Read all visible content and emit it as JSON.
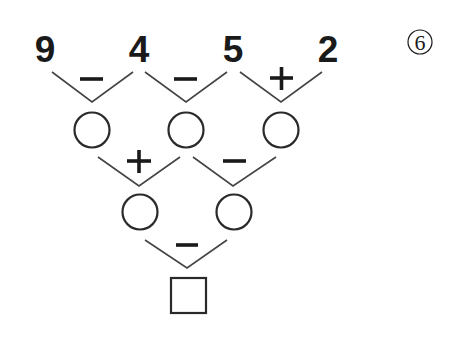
{
  "problem": {
    "label": "⑥",
    "label_number": "6",
    "top_numbers": [
      "9",
      "4",
      "5",
      "2"
    ],
    "row1_operators": [
      "-",
      "-",
      "+"
    ],
    "row2_operators": [
      "+",
      "-"
    ],
    "row3_operators": [
      "-"
    ],
    "row1_blanks": [
      "",
      "",
      ""
    ],
    "row2_blanks": [
      "",
      ""
    ],
    "answer_box": ""
  }
}
